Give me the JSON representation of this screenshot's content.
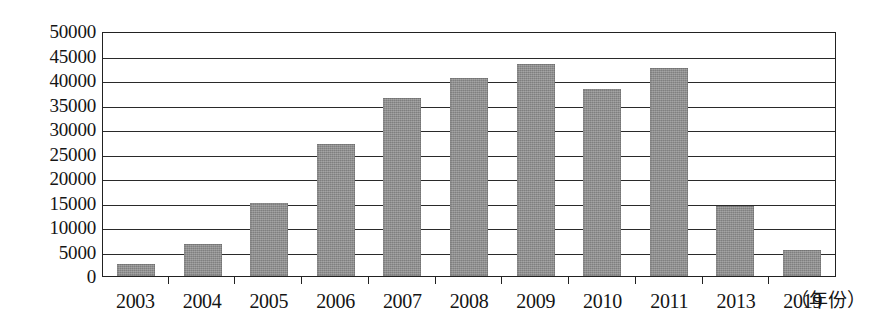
{
  "chart_data": {
    "type": "bar",
    "title": "",
    "xlabel": "（年份）",
    "ylabel": "",
    "categories": [
      "2003",
      "2004",
      "2005",
      "2006",
      "2007",
      "2008",
      "2009",
      "2010",
      "2011",
      "2013",
      "2019"
    ],
    "values": [
      2400,
      6500,
      15000,
      27000,
      36400,
      40400,
      43300,
      38100,
      42400,
      14200,
      5300
    ],
    "ylim": [
      0,
      50000
    ],
    "ytick_step": 5000,
    "yticks": [
      "50000",
      "45000",
      "40000",
      "35000",
      "30000",
      "25000",
      "20000",
      "15000",
      "10000",
      "5000",
      "0"
    ],
    "ytick_values": [
      50000,
      45000,
      40000,
      35000,
      30000,
      25000,
      20000,
      15000,
      10000,
      5000,
      0
    ],
    "grid": true,
    "legend": null,
    "bar_color": "#8b8b8b",
    "axis_color": "#222222"
  }
}
